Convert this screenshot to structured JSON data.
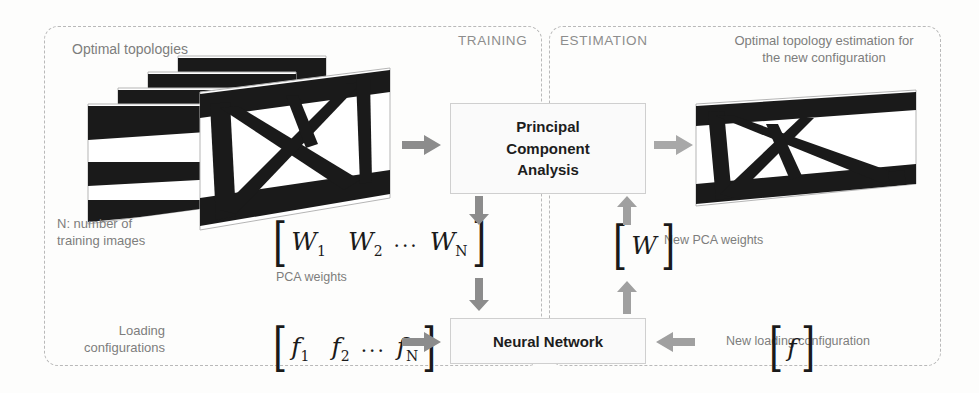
{
  "panels": {
    "training": {
      "label": "TRAINING"
    },
    "estimation": {
      "label": "ESTIMATION"
    }
  },
  "captions": {
    "optimal_topologies": "Optimal topologies",
    "n_training_images": "N: number of training images",
    "pca_weights": "PCA weights",
    "loading_configurations": "Loading configurations",
    "new_pca_weights": "New PCA weights",
    "new_loading_configuration": "New loading configuration",
    "estimation_result": "Optimal topology estimation for the new configuration"
  },
  "boxes": {
    "pca": {
      "line1": "Principal",
      "line2": "Component",
      "line3": "Analysis"
    },
    "neural_network": {
      "label": "Neural Network"
    }
  },
  "vectors": {
    "pca_weights_training": {
      "open": "[",
      "close": "]",
      "items": [
        {
          "symbol": "W",
          "sub": "1"
        },
        {
          "symbol": "W",
          "sub": "2"
        },
        {
          "symbol": "W",
          "sub": "N"
        }
      ],
      "ellipsis": "..."
    },
    "loading_training": {
      "open": "[",
      "close": "]",
      "items": [
        {
          "symbol": "f",
          "sub": "1"
        },
        {
          "symbol": "f",
          "sub": "2"
        },
        {
          "symbol": "f",
          "sub": "N"
        }
      ],
      "ellipsis": "..."
    },
    "pca_weights_new": {
      "open": "[",
      "close": "]",
      "items": [
        {
          "symbol": "W",
          "sub": ""
        }
      ]
    },
    "loading_new": {
      "open": "[",
      "close": "]",
      "items": [
        {
          "symbol": "f",
          "sub": ""
        }
      ]
    }
  },
  "icons": {
    "arrow_stack_to_pca": "arrow-right-icon",
    "arrow_pca_to_result": "arrow-right-icon",
    "arrow_pca_to_weights": "arrow-down-icon",
    "arrow_weights_to_nn": "arrow-down-icon",
    "arrow_loading_to_nn": "arrow-right-icon",
    "arrow_nn_to_newweights": "arrow-up-icon",
    "arrow_newweights_to_pca": "arrow-up-icon",
    "arrow_newloading_to_nn": "arrow-left-icon"
  },
  "colors": {
    "arrow_gray": "#8c8c8c",
    "panel_dash": "#b9b9b9",
    "caption_text": "#7d7d7d",
    "box_border": "#cfcfcf",
    "box_fill": "#fafafa",
    "topology_black": "#1a1a1a"
  }
}
